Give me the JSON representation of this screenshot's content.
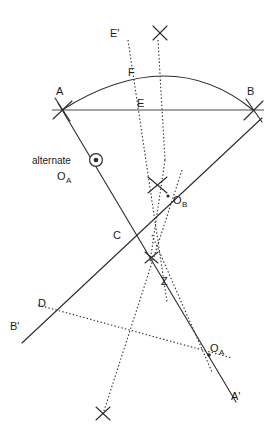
{
  "figure": {
    "background_color": "#ffffff",
    "stroke_color": "#2b2b2b",
    "width": 272,
    "height": 447
  },
  "labels": {
    "A": "A",
    "B": "B",
    "C": "C",
    "D": "D",
    "E": "E",
    "E_prime": "E'",
    "F": "F",
    "Z": "Z",
    "A_prime": "A'",
    "B_prime": "B'",
    "O_B_main": "O",
    "O_B_sub": "B",
    "O_A_main": "O",
    "O_A_sub": "A",
    "alternate_word": "alternate",
    "alternate_O_main": "O",
    "alternate_O_sub": "A"
  },
  "points": {
    "A": {
      "x": 62,
      "y": 110
    },
    "B": {
      "x": 253,
      "y": 110
    },
    "C": {
      "x": 131,
      "y": 240
    },
    "D": {
      "x": 52,
      "y": 311
    },
    "E": {
      "x": 155,
      "y": 110
    },
    "F": {
      "x": 145,
      "y": 80
    },
    "Z": {
      "x": 159,
      "y": 281
    },
    "A_prime": {
      "x": 232,
      "y": 395
    },
    "B_prime": {
      "x": 30,
      "y": 332
    },
    "O_B": {
      "x": 168,
      "y": 196
    },
    "O_A": {
      "x": 209,
      "y": 355
    },
    "alternate_O_A": {
      "x": 96,
      "y": 160
    }
  },
  "cross_marks": [
    {
      "name": "cross-top-center",
      "x": 160,
      "y": 33
    },
    {
      "name": "cross-at-O-B",
      "x": 157,
      "y": 185
    },
    {
      "name": "cross-above-Z",
      "x": 151,
      "y": 258
    },
    {
      "name": "cross-bottom",
      "x": 103,
      "y": 414
    }
  ],
  "tick_marks": [
    {
      "name": "tick-at-A",
      "x": 62,
      "y": 110
    },
    {
      "name": "tick-at-B",
      "x": 253,
      "y": 110
    }
  ],
  "elements": {
    "chord_AB": "chord-A-to-B",
    "arc_AB": "arc-through-F-from-A-to-B",
    "ray_A_to_Aprime": "ray-A-through-C-to-A-prime",
    "ray_B_to_Bprime": "ray-B-through-O-B-to-B-prime",
    "dotted_perp_E": "dotted-perpendicular-at-E",
    "dotted_perp_F": "dotted-perpendicular-at-F-labelled-E-prime",
    "dotted_OB_left": "dotted-bisector-left-of-O-B",
    "dotted_OB_right": "dotted-bisector-right-of-O-B",
    "dotted_D_to_OA": "dotted-line-D-to-O-A"
  }
}
